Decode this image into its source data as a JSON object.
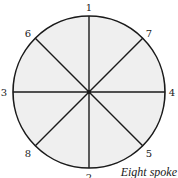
{
  "diagram": {
    "type": "wheel",
    "caption": "Eight spoke",
    "colors": {
      "fill": "#efefef",
      "stroke": "#1a1a1a",
      "text": "#1a1a1a"
    },
    "circle": {
      "cx": 89,
      "cy": 92,
      "r": 76
    },
    "spokes": [
      {
        "id": "1",
        "label": "1",
        "angle_deg": 90
      },
      {
        "id": "2",
        "label": "2",
        "angle_deg": 270
      },
      {
        "id": "3",
        "label": "3",
        "angle_deg": 180
      },
      {
        "id": "4",
        "label": "4",
        "angle_deg": 0
      },
      {
        "id": "5",
        "label": "5",
        "angle_deg": 315
      },
      {
        "id": "6",
        "label": "6",
        "angle_deg": 135
      },
      {
        "id": "7",
        "label": "7",
        "angle_deg": 45
      },
      {
        "id": "8",
        "label": "8",
        "angle_deg": 225
      }
    ],
    "spoke_count": 8
  }
}
